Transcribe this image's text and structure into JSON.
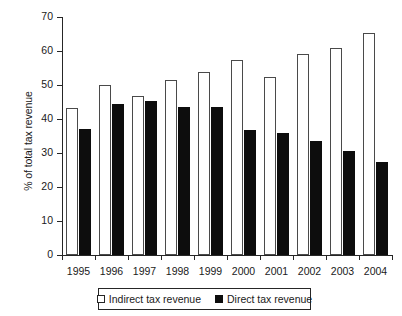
{
  "chart_data": {
    "type": "bar",
    "title": "",
    "xlabel": "",
    "ylabel": "% of total tax revenue",
    "ylim": [
      0,
      70
    ],
    "ytick_step": 10,
    "yticks": [
      70,
      60,
      50,
      40,
      30,
      20,
      10,
      0
    ],
    "grid": false,
    "legend_position": "bottom",
    "categories": [
      "1995",
      "1996",
      "1997",
      "1998",
      "1999",
      "2000",
      "2001",
      "2002",
      "2003",
      "2004"
    ],
    "series": [
      {
        "name": "Indirect tax revenue",
        "color": "#ffffff",
        "edge_color": "#4a4a4a",
        "values": [
          43.1,
          49.9,
          46.9,
          51.4,
          53.8,
          57.5,
          52.3,
          59.0,
          60.8,
          65.2
        ]
      },
      {
        "name": "Direct tax revenue",
        "color": "#0d0d0d",
        "edge_color": "#0d0d0d",
        "values": [
          37.0,
          44.5,
          45.3,
          43.6,
          43.6,
          36.7,
          35.8,
          33.4,
          30.6,
          27.3
        ]
      }
    ]
  },
  "legend": {
    "entries": [
      {
        "label": "Indirect tax revenue",
        "swatch": "white-square"
      },
      {
        "label": "Direct tax revenue",
        "swatch": "black-square"
      }
    ]
  }
}
